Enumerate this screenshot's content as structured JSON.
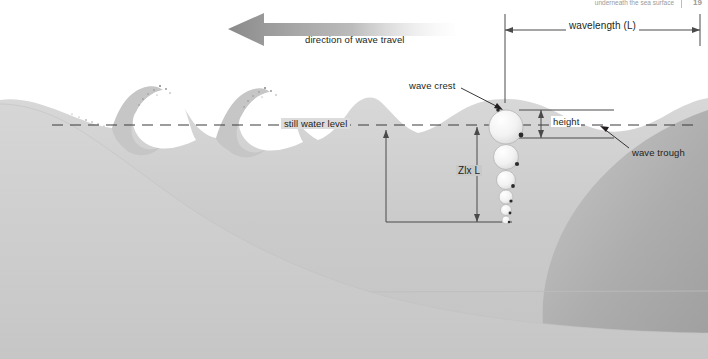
{
  "figure": {
    "header": {
      "running_head": "underneath the sea surface",
      "page_number": "19"
    },
    "labels": {
      "direction_of_travel": "direction of wave travel",
      "wavelength": "wavelength (L)",
      "wave_crest": "wave crest",
      "wave_trough": "wave trough",
      "height": "height",
      "still_water_level": "still water level",
      "orbital_depth": "Zlx L"
    },
    "colors": {
      "water_light": "#d2d2d2",
      "water_mid": "#c2c2c2",
      "water_deep": "#a9a9a9",
      "seafloor": "#cfcfcf",
      "foam": "#ffffff",
      "ink": "#231f20",
      "rule": "#6e6e6e",
      "arrow_dark": "#8f8f8f"
    },
    "orbital_circles": [
      {
        "index": 1,
        "cx": 506,
        "cy": 127,
        "r": 17
      },
      {
        "index": 2,
        "cx": 506,
        "cy": 157,
        "r": 12.5
      },
      {
        "index": 3,
        "cx": 506,
        "cy": 180,
        "r": 9.5
      },
      {
        "index": 4,
        "cx": 506,
        "cy": 197,
        "r": 7
      },
      {
        "index": 5,
        "cx": 506,
        "cy": 210,
        "r": 5.5
      },
      {
        "index": 6,
        "cx": 506,
        "cy": 220,
        "r": 4
      }
    ],
    "geometry": {
      "still_water_level_y": 125,
      "wavelength_span_x": [
        505,
        700
      ],
      "wavelength_dim_y": 30,
      "height_dim_x": 541,
      "height_span_y": [
        110,
        138
      ],
      "depth_arrow_x": 477,
      "depth_span_y": [
        127,
        222
      ]
    }
  }
}
